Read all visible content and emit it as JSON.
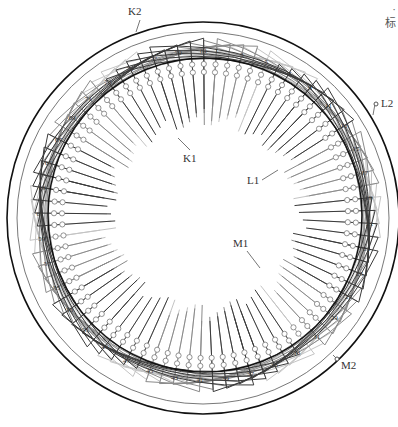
{
  "diagram": {
    "total_slots": 81,
    "slot_labels": [
      "1",
      "3",
      "5",
      "7",
      "9",
      "11",
      "13",
      "15",
      "17",
      "19",
      "21",
      "23",
      "25",
      "27",
      "29",
      "31",
      "33",
      "35",
      "37",
      "39",
      "41",
      "43",
      "45",
      "47",
      "49",
      "51",
      "53",
      "55",
      "57",
      "59",
      "61",
      "63",
      "65",
      "67",
      "69",
      "71",
      "73",
      "75",
      "77",
      "79",
      "81"
    ],
    "terminals": [
      {
        "id": "K1",
        "label": "K1"
      },
      {
        "id": "K2",
        "label": "K2"
      },
      {
        "id": "L1",
        "label": "L1"
      },
      {
        "id": "L2",
        "label": "L2"
      },
      {
        "id": "M1",
        "label": "M1"
      },
      {
        "id": "M2",
        "label": "M2"
      }
    ],
    "corner_text": [
      "·",
      "标"
    ],
    "colors": {
      "outer_ring": "#111111",
      "slot_circle": "#111111",
      "phase_dark": "#3a3a3a",
      "phase_mid": "#8a8a8a",
      "phase_light": "#c4c4c4",
      "background": "#ffffff"
    }
  }
}
